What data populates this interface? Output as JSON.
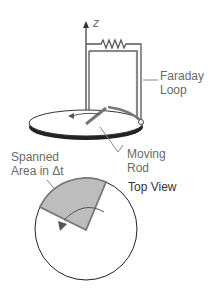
{
  "diagram": {
    "axis_label": "z",
    "labels": {
      "faraday_loop_line1": "Faraday",
      "faraday_loop_line2": "Loop",
      "moving_rod_line1": "Moving",
      "moving_rod_line2": "Rod",
      "spanned_line1": "Spanned",
      "spanned_line2": "Area in Δt",
      "top_view": "Top View"
    },
    "colors": {
      "line": "#555555",
      "text": "#6a6a6a",
      "shade": "#bdbdbd",
      "disk_edge": "#333333"
    }
  }
}
